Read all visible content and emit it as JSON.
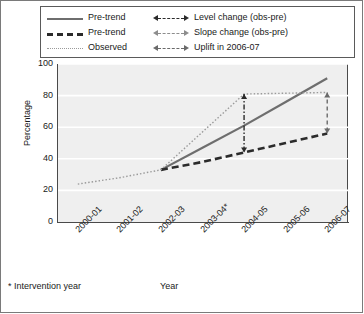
{
  "chart_data": {
    "type": "line",
    "title": "",
    "xlabel": "Year",
    "ylabel": "Percentage",
    "ylim": [
      0,
      100
    ],
    "yticks": [
      0,
      20,
      40,
      60,
      80,
      100
    ],
    "categories": [
      "2000-01",
      "2001-02",
      "2002-03",
      "2003-04*",
      "2004-05",
      "2005-06",
      "2006-07"
    ],
    "grid": true,
    "legend_position": "top",
    "intervention_year": "2003-04",
    "series": [
      {
        "name": "Pre-trend",
        "style": "solid",
        "color": "#6e6e6e",
        "x": [
          "2002-03",
          "2003-04*",
          "2004-05",
          "2005-06",
          "2006-07"
        ],
        "values": [
          33,
          47,
          61,
          76,
          91
        ]
      },
      {
        "name": "Pre-trend",
        "style": "dashed",
        "color": "#2b2b2b",
        "x": [
          "2002-03",
          "2003-04*",
          "2004-05",
          "2005-06",
          "2006-07"
        ],
        "values": [
          33,
          38,
          44,
          50,
          56
        ]
      },
      {
        "name": "Observed",
        "style": "dotted",
        "color": "#9a9a9a",
        "x": [
          "2000-01",
          "2001-02",
          "2002-03",
          "2003-04*",
          "2004-05",
          "2005-06",
          "2006-07"
        ],
        "values": [
          24,
          28,
          33,
          57,
          81,
          81.5,
          82
        ]
      }
    ],
    "annotations": [
      {
        "name": "Level change (obs-pre)",
        "type": "vertical-double-arrow",
        "style": "dash-dot",
        "color": "#2b2b2b",
        "at_x": "2004-05",
        "from_value": 44,
        "to_value": 81
      },
      {
        "name": "Slope change (obs-pre)",
        "type": "double-arrow",
        "style": "dashed",
        "color": "#8d8d8d"
      },
      {
        "name": "Uplift in 2006-07",
        "type": "vertical-double-arrow",
        "style": "dashed",
        "color": "#6a6a6a",
        "at_x": "2006-07",
        "from_value": 56,
        "to_value": 82
      }
    ]
  },
  "legend": {
    "left_column": [
      {
        "label": "Pre-trend",
        "key": "solid-line-key"
      },
      {
        "label": "Pre-trend",
        "key": "dashed-line-key"
      },
      {
        "label": "Observed",
        "key": "dotted-line-key"
      }
    ],
    "right_column": [
      {
        "label": "Level change (obs-pre)",
        "key": "dash-dot-arrow-key"
      },
      {
        "label": "Slope change (obs-pre)",
        "key": "dashed-grey-arrow-key"
      },
      {
        "label": "Uplift in 2006-07",
        "key": "dashed-arrow-key"
      }
    ]
  },
  "axes": {
    "y_title": "Percentage",
    "x_title": "Year",
    "y_tick_labels": [
      "100",
      "80",
      "60",
      "40",
      "20",
      "0"
    ],
    "x_tick_labels": [
      "2000-01",
      "2001-02",
      "2002-03",
      "2003-04*",
      "2004-05",
      "2005-06",
      "2006-07"
    ]
  },
  "footnote": "* Intervention year"
}
